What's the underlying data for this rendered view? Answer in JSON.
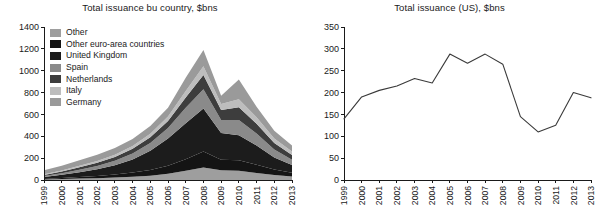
{
  "figure": {
    "width": 599,
    "height": 220,
    "background": "#ffffff"
  },
  "panels": {
    "left": {
      "title": "Total issuance bu country, $bns"
    },
    "right": {
      "title": "Total issuance (US), $bns"
    }
  },
  "chart_data": [
    {
      "type": "area",
      "stacked": true,
      "title": "Total issuance bu country, $bns",
      "xlabel": "",
      "ylabel": "",
      "ylim": [
        0,
        1400
      ],
      "yticks": [
        0,
        200,
        400,
        600,
        800,
        1000,
        1200,
        1400
      ],
      "ytick_labels": [
        "0",
        "200",
        "400",
        "600",
        "800",
        "1000",
        "1200",
        "1400"
      ],
      "grid": false,
      "legend_position": "upper-left",
      "categories": [
        "1999",
        "2000",
        "2001",
        "2002",
        "2003",
        "2004",
        "2005",
        "2006",
        "2007",
        "2008",
        "2009",
        "2010",
        "2011",
        "2012",
        "2013"
      ],
      "series": [
        {
          "name": "Germany",
          "color": "#9a9a9a",
          "values": [
            38,
            42,
            50,
            55,
            60,
            65,
            72,
            80,
            120,
            150,
            75,
            180,
            95,
            70,
            55
          ]
        },
        {
          "name": "Italy",
          "color": "#bdbdbd",
          "values": [
            6,
            10,
            14,
            18,
            22,
            26,
            32,
            40,
            60,
            80,
            55,
            75,
            60,
            42,
            32
          ]
        },
        {
          "name": "Netherlands",
          "color": "#3d3d3d",
          "values": [
            10,
            16,
            22,
            28,
            34,
            42,
            52,
            65,
            95,
            130,
            90,
            115,
            90,
            60,
            42
          ]
        },
        {
          "name": "Spain",
          "color": "#8a8a8a",
          "values": [
            8,
            14,
            22,
            30,
            40,
            55,
            72,
            95,
            140,
            175,
            120,
            140,
            110,
            72,
            48
          ]
        },
        {
          "name": "United Kingdom",
          "color": "#1c1c1c",
          "values": [
            18,
            30,
            45,
            62,
            85,
            120,
            175,
            250,
            330,
            395,
            245,
            230,
            175,
            110,
            72
          ]
        },
        {
          "name": "Other euro-area countries",
          "color": "#141414",
          "values": [
            5,
            9,
            14,
            20,
            28,
            38,
            52,
            72,
            105,
            145,
            95,
            95,
            75,
            50,
            34
          ]
        },
        {
          "name": "Other",
          "color": "#9e9e9e",
          "values": [
            5,
            9,
            13,
            17,
            23,
            30,
            40,
            58,
            85,
            115,
            90,
            85,
            65,
            46,
            32
          ]
        }
      ],
      "totals": [
        90,
        130,
        180,
        230,
        292,
        376,
        495,
        660,
        935,
        1190,
        770,
        920,
        670,
        450,
        315
      ]
    },
    {
      "type": "line",
      "title": "Total issuance (US), $bns",
      "xlabel": "",
      "ylabel": "",
      "ylim": [
        0,
        350
      ],
      "yticks": [
        0,
        50,
        100,
        150,
        200,
        250,
        300,
        350
      ],
      "ytick_labels": [
        "0",
        "50",
        "100",
        "150",
        "200",
        "250",
        "300",
        "350"
      ],
      "grid": false,
      "legend_position": "none",
      "x": [
        "1999",
        "2000",
        "2001",
        "2002",
        "2003",
        "2004",
        "2005",
        "2006",
        "2007",
        "2008",
        "2009",
        "2010",
        "2011",
        "2012",
        "2013"
      ],
      "values": [
        140,
        190,
        205,
        215,
        232,
        222,
        288,
        267,
        288,
        265,
        145,
        110,
        125,
        200,
        188
      ],
      "series": [
        {
          "name": "Total issuance (US)",
          "color": "#3a3a3a",
          "values": [
            140,
            190,
            205,
            215,
            232,
            222,
            288,
            267,
            288,
            265,
            145,
            110,
            125,
            200,
            188
          ]
        }
      ]
    }
  ],
  "legend": {
    "items": [
      {
        "label": "Other",
        "color": "#9e9e9e"
      },
      {
        "label": "Other euro-area countries",
        "color": "#141414"
      },
      {
        "label": "United Kingdom",
        "color": "#1c1c1c"
      },
      {
        "label": "Spain",
        "color": "#8a8a8a"
      },
      {
        "label": "Netherlands",
        "color": "#3d3d3d"
      },
      {
        "label": "Italy",
        "color": "#bdbdbd"
      },
      {
        "label": "Germany",
        "color": "#9a9a9a"
      }
    ]
  }
}
